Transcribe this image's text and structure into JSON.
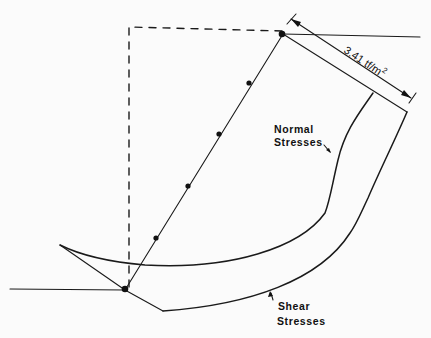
{
  "figure": {
    "type": "slope stability stress distribution diagram",
    "dimension_label": "3.41 tf/m",
    "dimension_superscript": "2",
    "labels": {
      "normal_stresses_line1": "Normal",
      "normal_stresses_line2": "Stresses",
      "shear_stresses_line1": "Shear",
      "shear_stresses_line2": "Stresses"
    },
    "slice_points_count": 6
  }
}
